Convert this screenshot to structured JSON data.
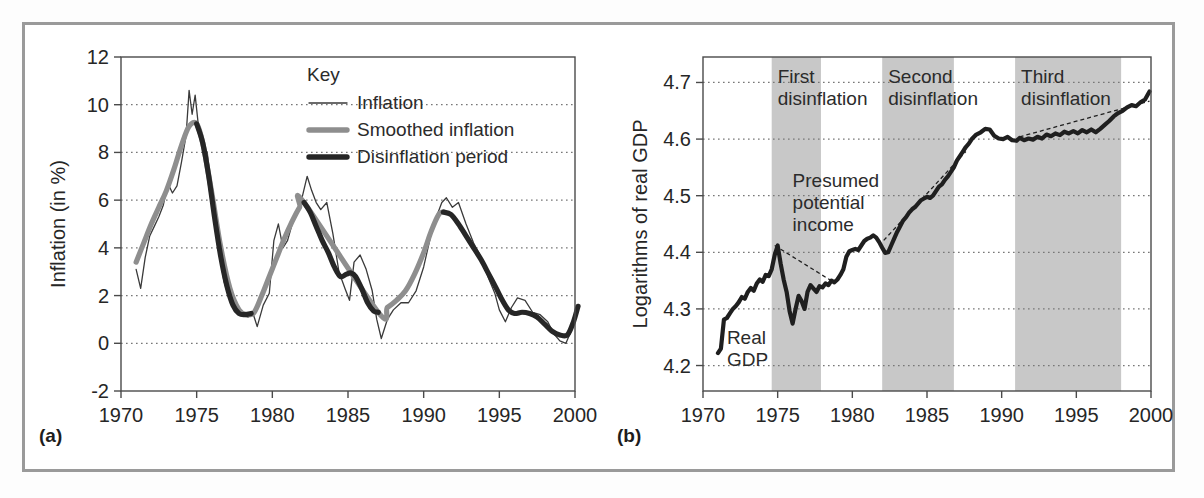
{
  "figure": {
    "panel_a_label": "(a)",
    "panel_b_label": "(b)"
  },
  "chart_data": [
    {
      "id": "panel-a",
      "type": "line",
      "title": "",
      "xlabel": "",
      "ylabel": "Inflation (in %)",
      "xlim": [
        1970,
        2000
      ],
      "ylim": [
        -2,
        12
      ],
      "xticks": [
        1970,
        1975,
        1980,
        1985,
        1990,
        1995,
        2000
      ],
      "xticklabels": [
        "1970",
        "1975",
        "1980",
        "1985",
        "1990",
        "1995",
        "2000"
      ],
      "yticks": [
        -2,
        0,
        2,
        4,
        6,
        8,
        10,
        12
      ],
      "yticklabels": [
        "-2",
        "0",
        "2",
        "4",
        "6",
        "8",
        "10",
        "12"
      ],
      "grid": "horizontal-dotted",
      "legend": {
        "title": "Key",
        "position": "top-right",
        "entries": [
          {
            "label": "Inflation",
            "style": "thin-line",
            "color": "#3a3a3a"
          },
          {
            "label": "Smoothed inflation",
            "style": "thick-gray-line",
            "color": "#8e8e8e"
          },
          {
            "label": "Disinflation period",
            "style": "thick-black-line",
            "color": "#262626"
          }
        ]
      },
      "series": [
        {
          "name": "Inflation",
          "x": [
            1971.0,
            1971.3,
            1971.6,
            1971.9,
            1972.2,
            1972.5,
            1972.8,
            1973.1,
            1973.4,
            1973.7,
            1974.0,
            1974.3,
            1974.5,
            1974.7,
            1974.9,
            1975.1,
            1975.4,
            1975.7,
            1976.0,
            1976.4,
            1976.8,
            1977.2,
            1977.6,
            1978.0,
            1978.4,
            1978.7,
            1979.0,
            1979.4,
            1979.8,
            1980.1,
            1980.4,
            1980.7,
            1981.0,
            1981.4,
            1981.7,
            1982.0,
            1982.3,
            1982.6,
            1982.9,
            1983.2,
            1983.6,
            1984.0,
            1984.4,
            1984.8,
            1985.1,
            1985.4,
            1985.8,
            1986.2,
            1986.6,
            1986.9,
            1987.2,
            1987.6,
            1988.0,
            1988.5,
            1989.0,
            1989.5,
            1990.0,
            1990.5,
            1990.9,
            1991.2,
            1991.5,
            1991.9,
            1992.3,
            1992.8,
            1993.3,
            1993.8,
            1994.3,
            1994.7,
            1995.0,
            1995.4,
            1995.8,
            1996.2,
            1996.7,
            1997.2,
            1997.7,
            1998.2,
            1998.6,
            1999.0,
            1999.4,
            1999.8,
            2000.2
          ],
          "y": [
            3.1,
            2.3,
            3.6,
            4.5,
            4.9,
            5.3,
            5.8,
            6.7,
            6.3,
            6.6,
            7.6,
            8.7,
            10.6,
            9.6,
            10.4,
            9.2,
            8.3,
            8.0,
            6.1,
            4.2,
            2.6,
            1.8,
            1.3,
            1.2,
            1.1,
            1.3,
            0.7,
            1.6,
            2.1,
            4.3,
            5.0,
            4.0,
            4.3,
            5.2,
            5.5,
            6.2,
            7.0,
            6.4,
            5.9,
            5.6,
            5.9,
            4.6,
            3.0,
            2.3,
            1.8,
            3.4,
            3.7,
            3.1,
            2.2,
            1.0,
            0.2,
            1.0,
            1.4,
            1.7,
            1.7,
            2.2,
            3.2,
            4.6,
            5.4,
            5.9,
            6.1,
            5.7,
            5.9,
            5.0,
            4.2,
            3.6,
            2.7,
            2.1,
            1.4,
            0.9,
            1.5,
            1.9,
            1.8,
            1.3,
            1.2,
            0.9,
            0.4,
            0.1,
            0.0,
            0.6,
            1.5
          ]
        },
        {
          "name": "Smoothed inflation",
          "x": [
            1971.0,
            1971.5,
            1972.0,
            1972.5,
            1973.0,
            1973.5,
            1974.0,
            1974.5,
            1975.0,
            1975.4,
            1976.0,
            1976.6,
            1977.2,
            1977.8,
            1978.3,
            1978.8,
            1979.3,
            1979.8,
            1980.3,
            1980.8,
            1981.3,
            1981.8,
            1982.1,
            1987.0,
            1987.6,
            1988.2,
            1988.8,
            1989.4,
            1990.0,
            1990.5,
            1991.0,
            1991.3
          ],
          "y": [
            3.4,
            4.2,
            5.0,
            5.7,
            6.4,
            7.3,
            8.3,
            9.1,
            9.2,
            8.4,
            6.3,
            4.0,
            2.3,
            1.4,
            1.2,
            1.3,
            2.0,
            2.8,
            3.6,
            4.4,
            5.1,
            5.7,
            5.9,
            1.3,
            1.5,
            1.8,
            2.2,
            2.9,
            3.8,
            4.7,
            5.4,
            5.5
          ]
        },
        {
          "name": "Disinflation period",
          "segments": [
            {
              "x": [
                1975.0,
                1975.4,
                1975.8,
                1976.2,
                1976.6,
                1977.0,
                1977.4,
                1977.8,
                1978.2,
                1978.6
              ],
              "y": [
                9.2,
                8.4,
                7.0,
                5.2,
                3.6,
                2.4,
                1.6,
                1.25,
                1.2,
                1.25
              ]
            },
            {
              "x": [
                1982.1,
                1982.5,
                1982.9,
                1983.3,
                1983.7,
                1984.1,
                1984.5,
                1984.9,
                1985.2,
                1985.5,
                1985.9,
                1986.3,
                1986.7,
                1987.0
              ],
              "y": [
                5.9,
                5.5,
                4.9,
                4.3,
                3.8,
                3.2,
                2.8,
                2.9,
                2.95,
                2.8,
                2.3,
                1.7,
                1.35,
                1.3
              ]
            },
            {
              "x": [
                1991.3,
                1991.8,
                1992.3,
                1992.8,
                1993.3,
                1993.8,
                1994.3,
                1994.8,
                1995.2,
                1995.6,
                1996.0,
                1996.5,
                1997.0,
                1997.5,
                1998.0,
                1998.5,
                1999.0,
                1999.5,
                1999.9,
                2000.2
              ],
              "y": [
                5.5,
                5.4,
                5.0,
                4.5,
                4.0,
                3.5,
                2.9,
                2.3,
                1.8,
                1.4,
                1.25,
                1.3,
                1.25,
                1.1,
                0.8,
                0.5,
                0.35,
                0.35,
                0.9,
                1.55
              ]
            }
          ]
        }
      ]
    },
    {
      "id": "panel-b",
      "type": "line",
      "title": "",
      "xlabel": "",
      "ylabel": "Logarithms of real GDP",
      "xlim": [
        1970,
        2000
      ],
      "ylim": [
        4.155,
        4.745
      ],
      "xticks": [
        1970,
        1975,
        1980,
        1985,
        1990,
        1995,
        2000
      ],
      "xticklabels": [
        "1970",
        "1975",
        "1980",
        "1985",
        "1990",
        "1995",
        "2000"
      ],
      "yticks": [
        4.2,
        4.3,
        4.4,
        4.5,
        4.6,
        4.7
      ],
      "yticklabels": [
        "4.2",
        "4.3",
        "4.4",
        "4.5",
        "4.6",
        "4.7"
      ],
      "grid": "horizontal-dotted",
      "shaded_bands": [
        {
          "label": "First\ndisinflation",
          "label_line1": "First",
          "label_line2": "disinflation",
          "x0": 1974.6,
          "x1": 1977.9,
          "color": "#c8c8c8"
        },
        {
          "label": "Second\ndisinflation",
          "label_line1": "Second",
          "label_line2": "disinflation",
          "x0": 1982.0,
          "x1": 1986.8,
          "color": "#c8c8c8"
        },
        {
          "label": "Third\ndisinflation",
          "label_line1": "Third",
          "label_line2": "disinflation",
          "x0": 1990.9,
          "x1": 1998.0,
          "color": "#c8c8c8"
        }
      ],
      "annotations": [
        {
          "name": "real-gdp-label",
          "line1": "Real",
          "line2": "GDP",
          "x": 1971.6,
          "y": 4.238
        },
        {
          "name": "presumed-potential-income-label",
          "line1": "Presumed",
          "line2": "potential",
          "line3": "income",
          "x": 1976.0,
          "y": 4.515
        }
      ],
      "series": [
        {
          "name": "Real GDP",
          "x": [
            1971.0,
            1971.2,
            1971.4,
            1971.6,
            1971.8,
            1972.0,
            1972.2,
            1972.4,
            1972.6,
            1972.8,
            1973.0,
            1973.2,
            1973.4,
            1973.6,
            1973.8,
            1974.0,
            1974.2,
            1974.4,
            1974.6,
            1974.8,
            1975.0,
            1975.2,
            1975.4,
            1975.6,
            1975.8,
            1976.0,
            1976.2,
            1976.4,
            1976.6,
            1976.8,
            1977.0,
            1977.2,
            1977.4,
            1977.6,
            1977.8,
            1978.0,
            1978.2,
            1978.4,
            1978.6,
            1978.8,
            1979.0,
            1979.2,
            1979.4,
            1979.6,
            1979.8,
            1980.0,
            1980.2,
            1980.4,
            1980.6,
            1980.8,
            1981.0,
            1981.2,
            1981.4,
            1981.6,
            1981.8,
            1982.0,
            1982.2,
            1982.4,
            1982.6,
            1982.8,
            1983.0,
            1983.2,
            1983.4,
            1983.6,
            1983.8,
            1984.0,
            1984.2,
            1984.4,
            1984.6,
            1984.8,
            1985.0,
            1985.2,
            1985.4,
            1985.6,
            1985.8,
            1986.0,
            1986.2,
            1986.4,
            1986.6,
            1986.8,
            1987.0,
            1987.2,
            1987.4,
            1987.6,
            1987.8,
            1988.0,
            1988.3,
            1988.6,
            1988.9,
            1989.2,
            1989.5,
            1989.8,
            1990.1,
            1990.4,
            1990.7,
            1991.0,
            1991.2,
            1991.5,
            1991.8,
            1992.1,
            1992.4,
            1992.7,
            1993.0,
            1993.3,
            1993.6,
            1993.9,
            1994.2,
            1994.5,
            1994.8,
            1995.1,
            1995.4,
            1995.7,
            1996.0,
            1996.3,
            1996.6,
            1996.9,
            1997.2,
            1997.5,
            1997.8,
            1998.1,
            1998.4,
            1998.7,
            1999.0,
            1999.3,
            1999.6,
            1999.9
          ],
          "y": [
            4.222,
            4.23,
            4.281,
            4.284,
            4.292,
            4.3,
            4.305,
            4.312,
            4.321,
            4.318,
            4.33,
            4.337,
            4.332,
            4.345,
            4.352,
            4.348,
            4.36,
            4.358,
            4.37,
            4.395,
            4.412,
            4.38,
            4.352,
            4.33,
            4.296,
            4.274,
            4.3,
            4.323,
            4.314,
            4.3,
            4.33,
            4.342,
            4.336,
            4.33,
            4.34,
            4.338,
            4.345,
            4.342,
            4.35,
            4.347,
            4.352,
            4.36,
            4.37,
            4.392,
            4.402,
            4.404,
            4.406,
            4.404,
            4.412,
            4.42,
            4.424,
            4.426,
            4.43,
            4.426,
            4.418,
            4.408,
            4.399,
            4.4,
            4.412,
            4.424,
            4.436,
            4.446,
            4.456,
            4.462,
            4.47,
            4.476,
            4.48,
            4.486,
            4.492,
            4.495,
            4.498,
            4.496,
            4.5,
            4.508,
            4.516,
            4.52,
            4.528,
            4.534,
            4.542,
            4.55,
            4.562,
            4.57,
            4.578,
            4.586,
            4.592,
            4.6,
            4.608,
            4.612,
            4.618,
            4.617,
            4.606,
            4.601,
            4.6,
            4.604,
            4.598,
            4.597,
            4.602,
            4.598,
            4.601,
            4.599,
            4.604,
            4.601,
            4.608,
            4.605,
            4.61,
            4.607,
            4.613,
            4.61,
            4.614,
            4.61,
            4.616,
            4.612,
            4.617,
            4.612,
            4.618,
            4.625,
            4.632,
            4.64,
            4.646,
            4.65,
            4.656,
            4.66,
            4.658,
            4.665,
            4.67,
            4.684
          ]
        }
      ],
      "trend_lines": [
        {
          "name": "potential-income-trend-1",
          "x0": 1974.8,
          "y0": 4.412,
          "x1": 1978.7,
          "y1": 4.348
        },
        {
          "name": "potential-income-trend-2",
          "x0": 1982.1,
          "y0": 4.421,
          "x1": 1987.6,
          "y1": 4.578
        },
        {
          "name": "potential-income-trend-3",
          "x0": 1991.2,
          "y0": 4.604,
          "x1": 1999.9,
          "y1": 4.667
        }
      ]
    }
  ]
}
